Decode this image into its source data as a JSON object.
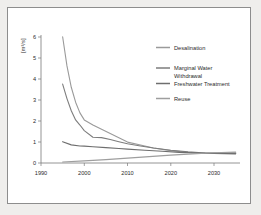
{
  "chart_data": {
    "type": "line",
    "title": "",
    "xlabel": "",
    "ylabel": "[m³/s]",
    "xlim": [
      1990,
      2036
    ],
    "ylim": [
      0,
      6
    ],
    "xticks": [
      1990,
      2000,
      2010,
      2020,
      2030
    ],
    "xtick_labels": [
      "1990",
      "2000",
      "2010",
      "2020",
      "2030"
    ],
    "yticks": [
      0,
      1,
      2,
      3,
      4,
      5,
      6
    ],
    "ytick_labels": [
      "0",
      "1",
      "2",
      "3",
      "4",
      "5",
      "6"
    ],
    "grid": false,
    "legend_position": "right-top",
    "series": [
      {
        "name": "Desalination",
        "color": "#9a9a9a",
        "x": [
          1995,
          1996,
          1997,
          1998,
          1999,
          2000,
          2002,
          2004,
          2006,
          2008,
          2010,
          2013,
          2016,
          2020,
          2024,
          2028,
          2032,
          2035
        ],
        "y": [
          5.92,
          4.55,
          3.55,
          2.85,
          2.35,
          2.02,
          1.78,
          1.58,
          1.38,
          1.18,
          0.98,
          0.84,
          0.7,
          0.58,
          0.5,
          0.46,
          0.46,
          0.48
        ]
      },
      {
        "name": "Marginal Water Withdrawal",
        "color": "#7d7d7d",
        "x": [
          1995,
          1996,
          1997,
          1998,
          1999,
          2000,
          2002,
          2004,
          2006,
          2008,
          2010,
          2013,
          2016,
          2020,
          2024,
          2028,
          2032,
          2035
        ],
        "y": [
          3.7,
          3.02,
          2.45,
          2.02,
          1.78,
          1.52,
          1.21,
          1.19,
          1.1,
          1.0,
          0.9,
          0.8,
          0.7,
          0.6,
          0.52,
          0.47,
          0.45,
          0.45
        ]
      },
      {
        "name": "Freshwater Treatment",
        "color": "#6e6e6e",
        "x": [
          1995,
          1997,
          1999,
          2000,
          2002,
          2005,
          2008,
          2010,
          2014,
          2018,
          2022,
          2026,
          2030,
          2035
        ],
        "y": [
          1.0,
          0.85,
          0.8,
          0.79,
          0.76,
          0.72,
          0.68,
          0.65,
          0.6,
          0.55,
          0.5,
          0.47,
          0.45,
          0.43
        ]
      },
      {
        "name": "Reuse",
        "color": "#9e9e9e",
        "x": [
          1995,
          2000,
          2005,
          2010,
          2015,
          2020,
          2025,
          2030,
          2035
        ],
        "y": [
          0.05,
          0.1,
          0.16,
          0.23,
          0.3,
          0.37,
          0.43,
          0.48,
          0.51
        ]
      }
    ],
    "legend": [
      {
        "label": "Desalination",
        "color": "#9a9a9a"
      },
      {
        "label": "Marginal Water",
        "color": "#7d7d7d"
      },
      {
        "label": "Withdrawal",
        "color": "#7d7d7d"
      },
      {
        "label": "Freshwater Treatment",
        "color": "#6e6e6e"
      },
      {
        "label": "Reuse",
        "color": "#9e9e9e"
      }
    ]
  }
}
